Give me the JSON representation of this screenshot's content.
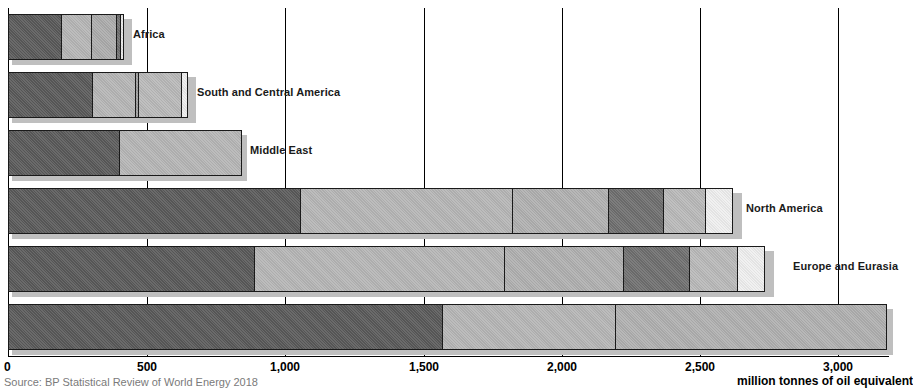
{
  "chart_data": {
    "type": "bar",
    "orientation": "horizontal",
    "stacked": true,
    "title": "",
    "subtitle": "",
    "xlabel": "million tonnes of oil equivalent",
    "ylabel": "",
    "xlim": [
      0,
      3180
    ],
    "xticks": [
      0,
      500,
      1000,
      1500,
      2000,
      2500,
      3000
    ],
    "xtick_labels": [
      "0",
      "500",
      "1,000",
      "1,500",
      "2,000",
      "2,500",
      "3,000"
    ],
    "grid": true,
    "legend": "none",
    "source": "Source: BP Statistical Review of World Energy 2018",
    "categories": [
      "Africa",
      "South and Central America",
      "Middle East",
      "North America",
      "Europe and Eurasia",
      "Asia Pacific"
    ],
    "series": [
      {
        "name": "Oil",
        "color": "#595959",
        "values": [
          196,
          307,
          404,
          1058,
          891,
          1572
        ]
      },
      {
        "name": "Natural Gas",
        "color": "#b5b5b5",
        "values": [
          112,
          158,
          444,
          770,
          906,
          628
        ]
      },
      {
        "name": "Coal",
        "color": "#a8a8a8",
        "values": [
          95,
          16,
          0,
          346,
          434,
          1150
        ]
      },
      {
        "name": "Nuclear",
        "color": "#6e6e6e",
        "values": [
          8,
          158,
          0,
          202,
          241,
          95
        ]
      },
      {
        "name": "Hydro",
        "color": "#bdbdbd",
        "values": [
          0,
          0,
          0,
          155,
          176,
          120
        ]
      },
      {
        "name": "Renewables",
        "color": "#efefef",
        "values": [
          0,
          0,
          0,
          101,
          101,
          90
        ]
      }
    ],
    "bar_labels": [
      {
        "label": "Africa",
        "value_total": 411
      },
      {
        "label": "South and Central America",
        "value_total": 639
      },
      {
        "label": "Middle East",
        "value_total": 848
      },
      {
        "label": "North America",
        "value_total": 2632
      },
      {
        "label": "Europe and Eurasia",
        "value_total": 2749
      },
      {
        "label": "Asia Pacific",
        "value_total": 3655
      }
    ]
  },
  "axis": {
    "ticks": [
      {
        "label": "0",
        "x": 8
      },
      {
        "label": "500",
        "x": 147
      },
      {
        "label": "1,000",
        "x": 285
      },
      {
        "label": "1,500",
        "x": 424
      },
      {
        "label": "2,000",
        "x": 562
      },
      {
        "label": "2,500",
        "x": 700
      },
      {
        "label": "3,000",
        "x": 838
      }
    ],
    "title": "million tonnes of oil equivalent"
  },
  "footer": {
    "source": "Source: BP Statistical Review of World Energy 2018"
  },
  "rows": [
    {
      "label": "Africa",
      "top": 14,
      "segments": [
        {
          "name": "oil",
          "start": 8,
          "end": 62,
          "color": "#5a5a5a"
        },
        {
          "name": "natural-gas",
          "start": 62,
          "end": 93,
          "color": "#b6b6b6"
        },
        {
          "name": "coal",
          "start": 93,
          "end": 119,
          "color": "#acacac"
        },
        {
          "name": "nuclear",
          "start": 119,
          "end": 124,
          "color": "#6f6f6f"
        },
        {
          "name": "renewables",
          "start": 124,
          "end": 128,
          "color": "#e8e8e8"
        }
      ],
      "label_x": 133
    },
    {
      "label": "South and Central America",
      "top": 72,
      "segments": [
        {
          "name": "oil",
          "start": 8,
          "end": 93,
          "color": "#5a5a5a"
        },
        {
          "name": "natural-gas",
          "start": 93,
          "end": 137,
          "color": "#b6b6b6"
        },
        {
          "name": "coal",
          "start": 137,
          "end": 141,
          "color": "#9e9e9e"
        },
        {
          "name": "nuclear",
          "start": 141,
          "end": 185,
          "color": "#b9b9b9"
        },
        {
          "name": "renewables",
          "start": 185,
          "end": 192,
          "color": "#eeeeee"
        }
      ],
      "label_x": 197
    },
    {
      "label": "Middle East",
      "top": 130,
      "segments": [
        {
          "name": "oil",
          "start": 8,
          "end": 120,
          "color": "#5a5a5a"
        },
        {
          "name": "natural-gas",
          "start": 120,
          "end": 243,
          "color": "#b6b6b6"
        }
      ],
      "label_x": 250
    },
    {
      "label": "North America",
      "top": 188,
      "segments": [
        {
          "name": "oil",
          "start": 8,
          "end": 301,
          "color": "#5a5a5a"
        },
        {
          "name": "natural-gas",
          "start": 301,
          "end": 514,
          "color": "#b6b6b6"
        },
        {
          "name": "coal",
          "start": 514,
          "end": 611,
          "color": "#b0b0b0"
        },
        {
          "name": "nuclear",
          "start": 611,
          "end": 667,
          "color": "#6f6f6f"
        },
        {
          "name": "hydro",
          "start": 667,
          "end": 710,
          "color": "#b9b9b9"
        },
        {
          "name": "renewables",
          "start": 710,
          "end": 738,
          "color": "#efefef"
        }
      ],
      "label_x": 746
    },
    {
      "label": "Europe and Eurasia",
      "top": 246,
      "segments": [
        {
          "name": "oil",
          "start": 8,
          "end": 255,
          "color": "#5a5a5a"
        },
        {
          "name": "natural-gas",
          "start": 255,
          "end": 506,
          "color": "#b6b6b6"
        },
        {
          "name": "coal",
          "start": 506,
          "end": 626,
          "color": "#b0b0b0"
        },
        {
          "name": "nuclear",
          "start": 626,
          "end": 693,
          "color": "#6f6f6f"
        },
        {
          "name": "hydro",
          "start": 693,
          "end": 742,
          "color": "#b9b9b9"
        },
        {
          "name": "renewables",
          "start": 742,
          "end": 770,
          "color": "#efefef"
        }
      ],
      "label_x": 793
    },
    {
      "label": "Asia Pacific",
      "top": 304,
      "segments": [
        {
          "name": "oil",
          "start": 8,
          "end": 443,
          "color": "#5a5a5a"
        },
        {
          "name": "natural-gas",
          "start": 443,
          "end": 617,
          "color": "#b6b6b6"
        },
        {
          "name": "coal",
          "start": 617,
          "end": 889,
          "color": "#b0b0b0"
        }
      ],
      "label_x": 9999
    }
  ]
}
